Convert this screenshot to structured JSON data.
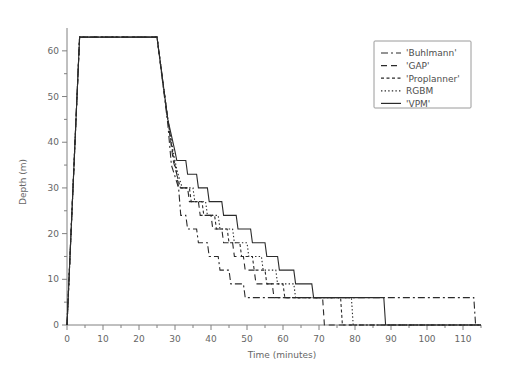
{
  "chart_data": {
    "type": "line",
    "title": "",
    "xlabel": "Time (minutes)",
    "ylabel": "Depth (m)",
    "xlim": [
      0,
      115
    ],
    "ylim": [
      0,
      65
    ],
    "y_inverted": true,
    "grid": false,
    "legend_position": "top-right",
    "x_ticks": [
      0,
      10,
      20,
      30,
      40,
      50,
      60,
      70,
      80,
      90,
      100,
      110
    ],
    "x_tick_labels": [
      "0",
      "10",
      "20",
      "30",
      "40",
      "50",
      "60",
      "70",
      "80",
      "90",
      "100",
      "110"
    ],
    "x_minor_ticks": [
      5,
      15,
      25,
      35,
      45,
      55,
      65,
      75,
      85,
      95,
      105,
      115
    ],
    "y_ticks": [
      0,
      10,
      20,
      30,
      40,
      50,
      60
    ],
    "y_tick_labels": [
      "0",
      "10",
      "20",
      "30",
      "40",
      "50",
      "60"
    ],
    "y_minor_ticks": [
      5,
      15,
      25,
      35,
      45,
      55
    ],
    "series": [
      {
        "name": "'Buhlmann'",
        "style": "dashdot",
        "dasharray": "7,3,2,3",
        "points": [
          [
            0,
            0
          ],
          [
            3.5,
            63
          ],
          [
            25,
            63
          ],
          [
            28,
            44
          ],
          [
            29,
            35
          ],
          [
            31,
            30
          ],
          [
            31.6,
            24
          ],
          [
            33,
            24
          ],
          [
            33.5,
            21
          ],
          [
            36,
            21
          ],
          [
            36.5,
            18
          ],
          [
            39,
            18
          ],
          [
            39.5,
            15
          ],
          [
            42,
            15
          ],
          [
            42.5,
            12
          ],
          [
            45,
            12
          ],
          [
            45.5,
            9
          ],
          [
            49,
            9
          ],
          [
            49.5,
            6
          ],
          [
            113,
            6
          ],
          [
            113.5,
            0
          ],
          [
            115,
            0
          ]
        ]
      },
      {
        "name": "'GAP'",
        "style": "dashed",
        "dasharray": "6,4",
        "points": [
          [
            0,
            0
          ],
          [
            3.5,
            63
          ],
          [
            25,
            63
          ],
          [
            28,
            45
          ],
          [
            29.5,
            36
          ],
          [
            30.5,
            33
          ],
          [
            31,
            30
          ],
          [
            33.5,
            30
          ],
          [
            34,
            27
          ],
          [
            36.5,
            27
          ],
          [
            37,
            24
          ],
          [
            40,
            24
          ],
          [
            40.5,
            21
          ],
          [
            43,
            21
          ],
          [
            43.5,
            18
          ],
          [
            46,
            18
          ],
          [
            46.5,
            15
          ],
          [
            49,
            15
          ],
          [
            49.5,
            12
          ],
          [
            52,
            12
          ],
          [
            52.5,
            9
          ],
          [
            57,
            9
          ],
          [
            57.5,
            6
          ],
          [
            71,
            6
          ],
          [
            71.5,
            0
          ],
          [
            115,
            0
          ]
        ]
      },
      {
        "name": "'Proplanner'",
        "style": "smalldash",
        "dasharray": "3,2.5",
        "points": [
          [
            0,
            0
          ],
          [
            3.5,
            63
          ],
          [
            25,
            63
          ],
          [
            28,
            45
          ],
          [
            29.5,
            37
          ],
          [
            30.5,
            33
          ],
          [
            31.5,
            30
          ],
          [
            34,
            30
          ],
          [
            34.5,
            27
          ],
          [
            37.5,
            27
          ],
          [
            38,
            24
          ],
          [
            41,
            24
          ],
          [
            41.5,
            21
          ],
          [
            44.5,
            21
          ],
          [
            45,
            18
          ],
          [
            48,
            18
          ],
          [
            48.5,
            15
          ],
          [
            51.5,
            15
          ],
          [
            52,
            12
          ],
          [
            55,
            12
          ],
          [
            55.5,
            9
          ],
          [
            60,
            9
          ],
          [
            60.5,
            6
          ],
          [
            76,
            6
          ],
          [
            76.5,
            0
          ],
          [
            115,
            0
          ]
        ]
      },
      {
        "name": "RGBM",
        "style": "dotted",
        "dasharray": "1.4,2.2",
        "points": [
          [
            0,
            0
          ],
          [
            3.5,
            63
          ],
          [
            25,
            63
          ],
          [
            28,
            45
          ],
          [
            29.5,
            38
          ],
          [
            30.5,
            34
          ],
          [
            32,
            30
          ],
          [
            35,
            30
          ],
          [
            35.5,
            27
          ],
          [
            38.5,
            27
          ],
          [
            39,
            24
          ],
          [
            42,
            24
          ],
          [
            42.5,
            21
          ],
          [
            46,
            21
          ],
          [
            46.5,
            18
          ],
          [
            50,
            18
          ],
          [
            50.5,
            15
          ],
          [
            54,
            15
          ],
          [
            54.5,
            12
          ],
          [
            58,
            12
          ],
          [
            58.5,
            9
          ],
          [
            63,
            9
          ],
          [
            63.5,
            6
          ],
          [
            79,
            6
          ],
          [
            79.5,
            0
          ],
          [
            115,
            0
          ]
        ]
      },
      {
        "name": "'VPM'",
        "style": "solid",
        "dasharray": "",
        "points": [
          [
            0,
            0
          ],
          [
            3.5,
            63
          ],
          [
            25,
            63
          ],
          [
            28,
            45
          ],
          [
            30,
            38
          ],
          [
            30.5,
            36
          ],
          [
            33,
            36
          ],
          [
            33.5,
            33
          ],
          [
            36,
            33
          ],
          [
            36.5,
            30
          ],
          [
            39,
            30
          ],
          [
            39.5,
            27
          ],
          [
            43,
            27
          ],
          [
            43.5,
            24
          ],
          [
            47,
            24
          ],
          [
            47.5,
            21
          ],
          [
            51,
            21
          ],
          [
            51.5,
            18
          ],
          [
            55,
            18
          ],
          [
            55.5,
            15
          ],
          [
            58.5,
            15
          ],
          [
            59,
            12
          ],
          [
            63,
            12
          ],
          [
            63.5,
            9
          ],
          [
            68,
            9
          ],
          [
            68.5,
            6
          ],
          [
            88,
            6
          ],
          [
            88.5,
            0
          ],
          [
            115,
            0
          ]
        ]
      }
    ]
  },
  "legend": {
    "entries": [
      {
        "label": "'Buhlmann'"
      },
      {
        "label": "'GAP'"
      },
      {
        "label": "'Proplanner'"
      },
      {
        "label": "RGBM"
      },
      {
        "label": "'VPM'"
      }
    ]
  },
  "colors": {
    "line": "#2b2b2b",
    "axis": "#808080",
    "text": "#666666",
    "legend_border": "#9a9a9a",
    "background": "#ffffff"
  }
}
